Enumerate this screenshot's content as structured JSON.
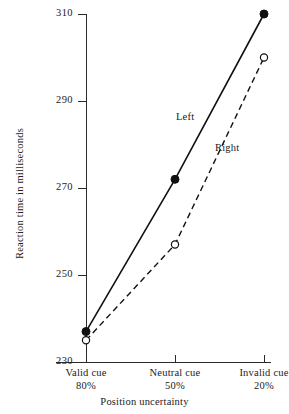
{
  "chart_data": {
    "type": "line",
    "title": "",
    "xlabel": "Position uncertainty",
    "ylabel": "Reaction time in milliseconds",
    "categories": [
      "Valid cue",
      "Neutral cue",
      "Invalid cue"
    ],
    "category_sublabels": [
      "80%",
      "50%",
      "20%"
    ],
    "ylim": [
      230,
      310
    ],
    "yticks": [
      310,
      290,
      270,
      250,
      230
    ],
    "ytick_labels": [
      "310",
      "290",
      "270",
      "250",
      "230"
    ],
    "grid": false,
    "legend": "inline-annotations",
    "series": [
      {
        "name": "Left",
        "marker": "filled-circle",
        "line": "solid",
        "values": [
          237,
          272,
          310
        ]
      },
      {
        "name": "Right",
        "marker": "open-circle",
        "line": "dashed",
        "values": [
          235,
          257,
          300
        ]
      }
    ],
    "annotations": [
      {
        "text": "Left",
        "series": "Left"
      },
      {
        "text": "Right",
        "series": "Right"
      }
    ],
    "colors": {
      "axis": "#2a2a2a",
      "left_series": "#111111",
      "right_series": "#111111",
      "background": "#ffffff"
    }
  }
}
